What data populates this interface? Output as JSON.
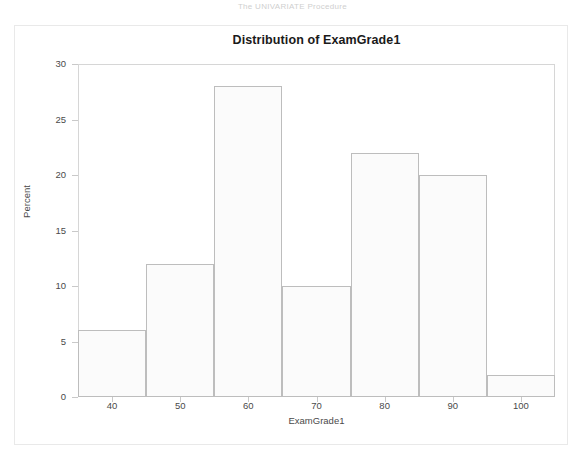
{
  "page": {
    "header_text": "The UNIVARIATE Procedure"
  },
  "chart_data": {
    "type": "bar",
    "title": "Distribution of ExamGrade1",
    "xlabel": "ExamGrade1",
    "ylabel": "Percent",
    "ylim": [
      0,
      30
    ],
    "xlim": [
      35,
      105
    ],
    "grid": false,
    "legend": null,
    "ytick_labels": [
      "0",
      "5",
      "10",
      "15",
      "20",
      "25",
      "30"
    ],
    "ytick_values": [
      0,
      5,
      10,
      15,
      20,
      25,
      30
    ],
    "xtick_labels": [
      "40",
      "50",
      "60",
      "70",
      "80",
      "90",
      "100"
    ],
    "xtick_values": [
      40,
      50,
      60,
      70,
      80,
      90,
      100
    ],
    "bin_edges": [
      35,
      45,
      55,
      65,
      75,
      85,
      95,
      105
    ],
    "bin_centers": [
      40,
      50,
      60,
      70,
      80,
      90,
      100
    ],
    "categories": [
      "35-45",
      "45-55",
      "55-65",
      "65-75",
      "75-85",
      "85-95",
      "95-105"
    ],
    "values": [
      6,
      12,
      28,
      10,
      22,
      20,
      2
    ],
    "bar_fill_color": "#fbfbfb",
    "bar_edge_color": "#bdbdbd"
  }
}
